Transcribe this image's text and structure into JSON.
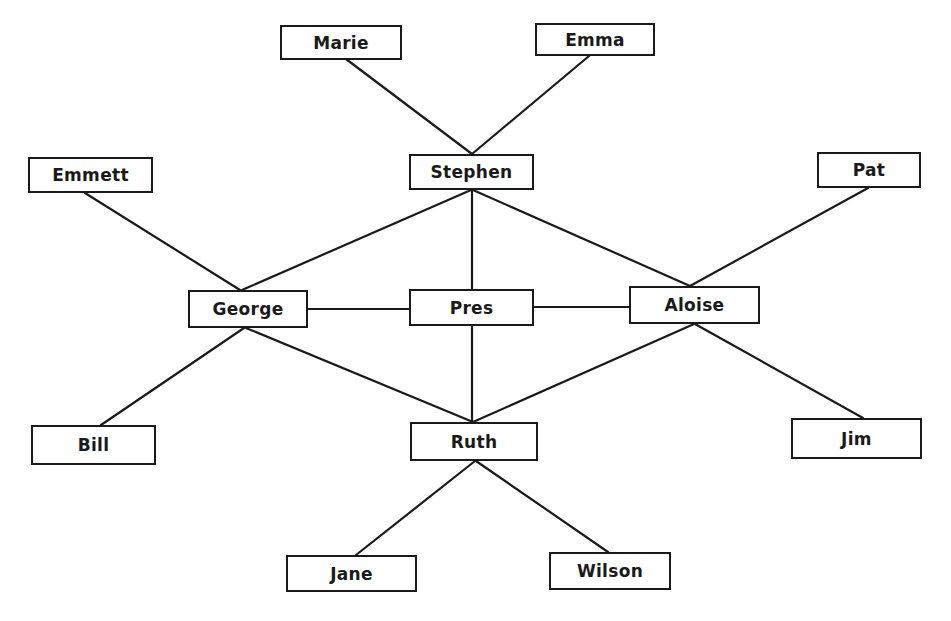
{
  "diagram": {
    "type": "sociogram",
    "colors": {
      "stroke": "#1a1a1a",
      "fill": "#ffffff",
      "text": "#1a1a1a"
    },
    "nodes": [
      {
        "id": "marie",
        "label": "Marie",
        "x": 280,
        "y": 25,
        "w": 122,
        "h": 35
      },
      {
        "id": "emma",
        "label": "Emma",
        "x": 535,
        "y": 23,
        "w": 120,
        "h": 33
      },
      {
        "id": "stephen",
        "label": "Stephen",
        "x": 409,
        "y": 154,
        "w": 125,
        "h": 36
      },
      {
        "id": "emmett",
        "label": "Emmett",
        "x": 28,
        "y": 157,
        "w": 125,
        "h": 36
      },
      {
        "id": "pat",
        "label": "Pat",
        "x": 817,
        "y": 152,
        "w": 104,
        "h": 36
      },
      {
        "id": "george",
        "label": "George",
        "x": 188,
        "y": 290,
        "w": 120,
        "h": 38
      },
      {
        "id": "pres",
        "label": "Pres",
        "x": 409,
        "y": 289,
        "w": 125,
        "h": 37
      },
      {
        "id": "aloise",
        "label": "Aloise",
        "x": 629,
        "y": 286,
        "w": 131,
        "h": 38
      },
      {
        "id": "bill",
        "label": "Bill",
        "x": 31,
        "y": 425,
        "w": 125,
        "h": 40
      },
      {
        "id": "ruth",
        "label": "Ruth",
        "x": 410,
        "y": 422,
        "w": 128,
        "h": 39
      },
      {
        "id": "jim",
        "label": "Jim",
        "x": 791,
        "y": 418,
        "w": 131,
        "h": 41
      },
      {
        "id": "jane",
        "label": "Jane",
        "x": 286,
        "y": 555,
        "w": 131,
        "h": 37
      },
      {
        "id": "wilson",
        "label": "Wilson",
        "x": 549,
        "y": 552,
        "w": 122,
        "h": 38
      }
    ],
    "edges": [
      {
        "from": "marie",
        "to": "stephen",
        "x1": 346,
        "y1": 59,
        "x2": 472,
        "y2": 154
      },
      {
        "from": "emma",
        "to": "stephen",
        "x1": 589,
        "y1": 56,
        "x2": 472,
        "y2": 154
      },
      {
        "from": "emmett",
        "to": "george",
        "x1": 85,
        "y1": 193,
        "x2": 240,
        "y2": 290
      },
      {
        "from": "stephen",
        "to": "george",
        "x1": 471,
        "y1": 190,
        "x2": 242,
        "y2": 290
      },
      {
        "from": "stephen",
        "to": "pres",
        "x1": 472,
        "y1": 190,
        "x2": 472,
        "y2": 289
      },
      {
        "from": "stephen",
        "to": "aloise",
        "x1": 473,
        "y1": 190,
        "x2": 690,
        "y2": 286
      },
      {
        "from": "pat",
        "to": "aloise",
        "x1": 868,
        "y1": 188,
        "x2": 690,
        "y2": 286
      },
      {
        "from": "george",
        "to": "pres",
        "x1": 308,
        "y1": 309,
        "x2": 409,
        "y2": 309
      },
      {
        "from": "pres",
        "to": "aloise",
        "x1": 534,
        "y1": 307,
        "x2": 629,
        "y2": 307
      },
      {
        "from": "george",
        "to": "bill",
        "x1": 244,
        "y1": 328,
        "x2": 101,
        "y2": 425
      },
      {
        "from": "george",
        "to": "ruth",
        "x1": 246,
        "y1": 328,
        "x2": 473,
        "y2": 422
      },
      {
        "from": "pres",
        "to": "ruth",
        "x1": 472,
        "y1": 326,
        "x2": 472,
        "y2": 422
      },
      {
        "from": "aloise",
        "to": "ruth",
        "x1": 694,
        "y1": 324,
        "x2": 473,
        "y2": 422
      },
      {
        "from": "aloise",
        "to": "jim",
        "x1": 695,
        "y1": 324,
        "x2": 863,
        "y2": 418
      },
      {
        "from": "ruth",
        "to": "jane",
        "x1": 475,
        "y1": 461,
        "x2": 356,
        "y2": 555
      },
      {
        "from": "ruth",
        "to": "wilson",
        "x1": 476,
        "y1": 461,
        "x2": 608,
        "y2": 552
      }
    ]
  }
}
